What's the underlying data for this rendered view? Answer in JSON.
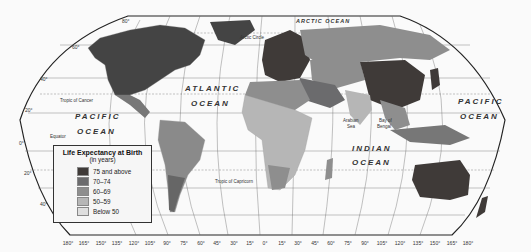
{
  "legend": {
    "title": "Life Expectancy at Birth",
    "subtitle": "(in years)",
    "items": [
      {
        "label": "75 and above",
        "color": "#3f3a38"
      },
      {
        "label": "70–74",
        "color": "#6b6b6d"
      },
      {
        "label": "60–69",
        "color": "#8e8e8e"
      },
      {
        "label": "50–59",
        "color": "#b6b6b6"
      },
      {
        "label": "Below 50",
        "color": "#dedede"
      }
    ]
  },
  "labels": {
    "oceans": {
      "atlantic_1": "ATLANTIC",
      "atlantic_2": "OCEAN",
      "pacific_w_1": "PACIFIC",
      "pacific_w_2": "OCEAN",
      "pacific_e_1": "PACIFIC",
      "pacific_e_2": "OCEAN",
      "indian_1": "INDIAN",
      "indian_2": "OCEAN",
      "arctic": "ARCTIC OCEAN"
    },
    "lines": {
      "arctic_circle": "Arctic Circle",
      "tropic_cancer": "Tropic of Cancer",
      "equator": "Equator",
      "tropic_capricorn": "Tropic of Capricorn"
    },
    "seas": {
      "arabian_1": "Arabian",
      "arabian_2": "Sea",
      "bengal_1": "Bay of",
      "bengal_2": "Bengal"
    }
  },
  "latitudes": [
    "80°",
    "60°",
    "40°",
    "20°",
    "0°",
    "20°",
    "40°"
  ],
  "longitudes": [
    "180°",
    "165°",
    "150°",
    "135°",
    "120°",
    "105°",
    "90°",
    "75°",
    "60°",
    "45°",
    "30°",
    "15°",
    "0°",
    "15°",
    "30°",
    "45°",
    "60°",
    "75°",
    "90°",
    "105°",
    "120°",
    "135°",
    "150°",
    "165°",
    "180°"
  ]
}
